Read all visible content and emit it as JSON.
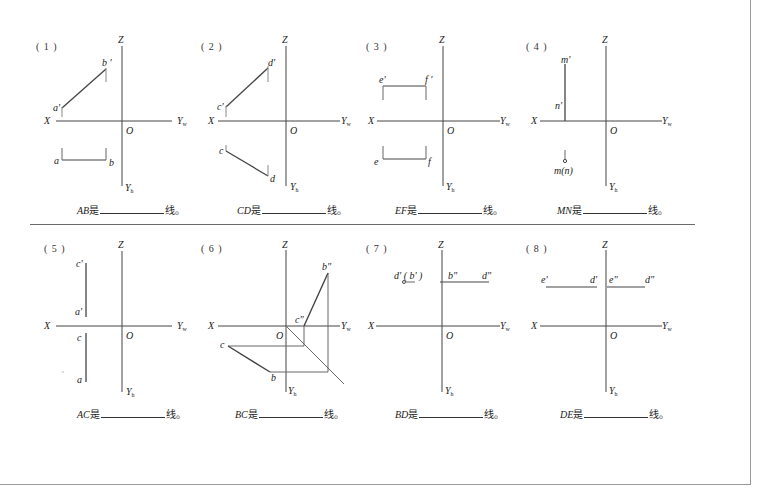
{
  "axes_labels": {
    "x": "X",
    "z": "Z",
    "origin": "O",
    "yw": "Y",
    "yw_sub": "w",
    "yh": "Y",
    "yh_sub": "h"
  },
  "answer_suffix": "线。",
  "answer_is": "是",
  "panels": [
    {
      "number": "( 1 )",
      "subject": "AB",
      "points": {
        "a_prime": "a'",
        "b_prime": "b '",
        "a": "a",
        "b": "b"
      }
    },
    {
      "number": "( 2 )",
      "subject": "CD",
      "points": {
        "c_prime": "c'",
        "d_prime": "d'",
        "c": "c",
        "d": "d"
      }
    },
    {
      "number": "( 3 )",
      "subject": "EF",
      "points": {
        "e_prime": "e'",
        "f_prime": "f '",
        "e": "e",
        "f": "f"
      }
    },
    {
      "number": "( 4 )",
      "subject": "MN",
      "points": {
        "m_prime": "m'",
        "n_prime": "n'",
        "mn": "m(n)"
      }
    },
    {
      "number": "( 5 )",
      "subject": "AC",
      "points": {
        "c_prime": "c'",
        "a_prime": "a'",
        "c": "c",
        "a": "a"
      }
    },
    {
      "number": "( 6 )",
      "subject": "BC",
      "points": {
        "b_dprime": "b\"",
        "c_dprime": "c\"",
        "c": "c",
        "b": "b"
      }
    },
    {
      "number": "( 7 )",
      "subject": "BD",
      "points": {
        "db_prime": "d' ( b' )",
        "b_dprime": "b\"",
        "d_dprime": "d\""
      }
    },
    {
      "number": "( 8 )",
      "subject": "DE",
      "points": {
        "e_prime": "e'",
        "d_prime": "d'",
        "e_dprime": "e\"",
        "d_dprime": "d\""
      }
    }
  ]
}
